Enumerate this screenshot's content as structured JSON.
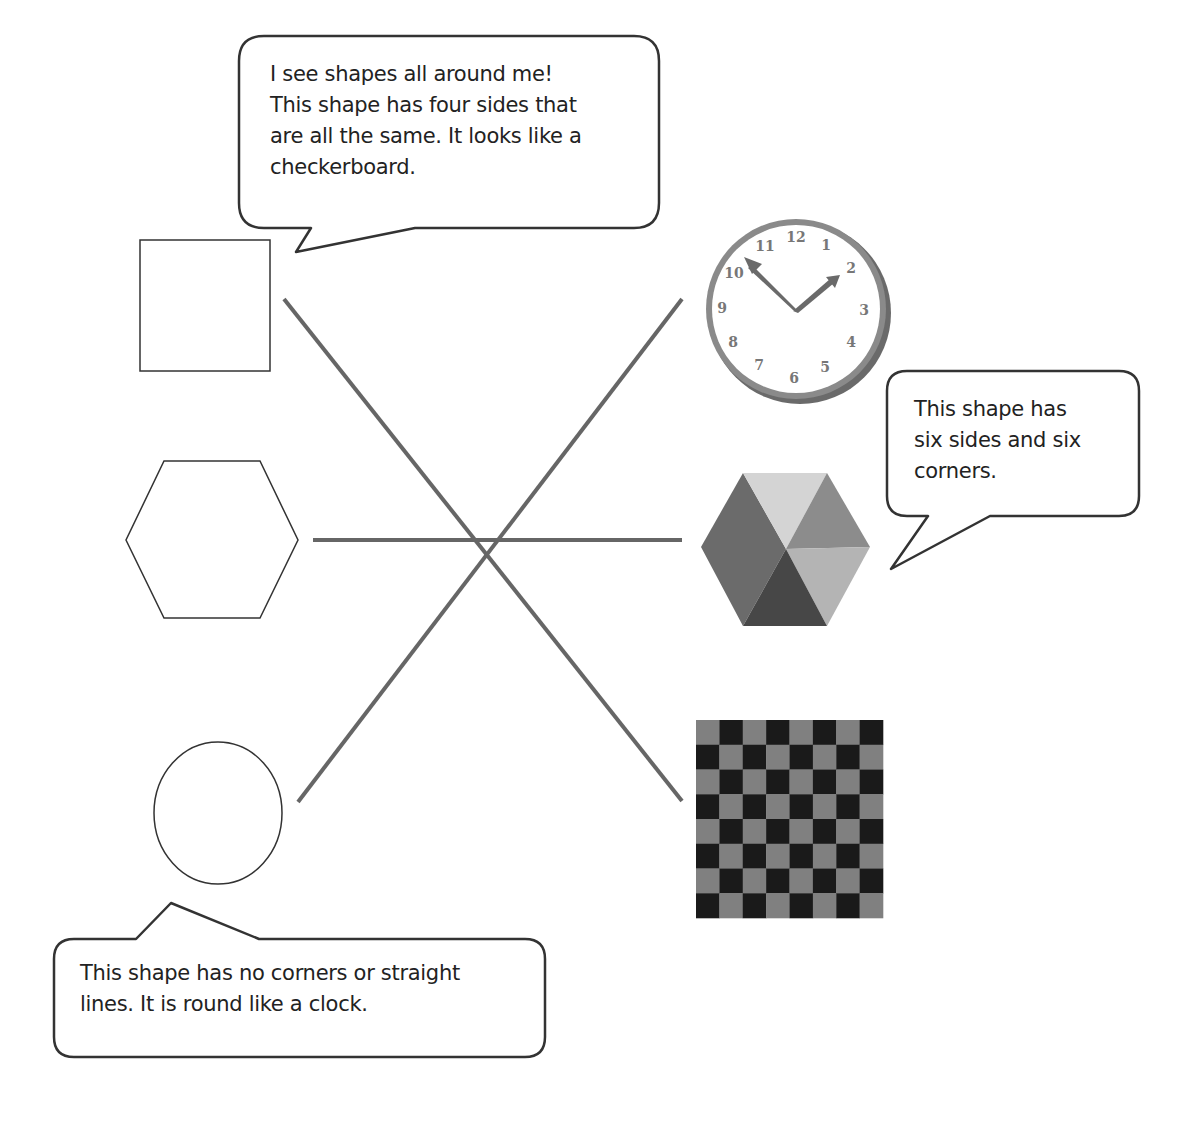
{
  "worksheet": {
    "title": "Match the shapes to real objects",
    "bubbles": [
      {
        "id": "square-bubble",
        "text": "I see shapes all around me!\nThis shape has four sides that\nare all the same.  It looks like a\ncheckerboard."
      },
      {
        "id": "hexagon-bubble",
        "text": "This shape has\nsix sides and six\ncorners."
      },
      {
        "id": "circle-bubble",
        "text": "This shape has no corners or straight\nlines.  It is round like a clock."
      }
    ],
    "left_shapes": [
      {
        "name": "square",
        "kind": "outline"
      },
      {
        "name": "hexagon",
        "kind": "outline"
      },
      {
        "name": "circle",
        "kind": "outline"
      }
    ],
    "right_objects": [
      {
        "name": "clock",
        "matches": "circle"
      },
      {
        "name": "colored-hexagon",
        "matches": "hexagon"
      },
      {
        "name": "checkerboard",
        "matches": "square"
      }
    ],
    "connections": [
      {
        "from": "square",
        "to": "checkerboard"
      },
      {
        "from": "hexagon",
        "to": "colored-hexagon"
      },
      {
        "from": "circle",
        "to": "clock"
      }
    ],
    "clock": {
      "numbers": [
        "12",
        "1",
        "2",
        "3",
        "4",
        "5",
        "6",
        "7",
        "8",
        "9",
        "10",
        "11"
      ],
      "time_shown": "10:10"
    },
    "checkerboard": {
      "rows": 8,
      "cols": 8
    },
    "colors": {
      "outline": "#333333",
      "connector_line": "#666666",
      "checker_light": "#808080",
      "checker_dark": "#1a1a1a",
      "hex_top": "#d4d4d4",
      "hex_upper_right": "#8c8c8c",
      "hex_lower_right": "#b4b4b4",
      "hex_bottom": "#474747",
      "hex_left": "#6b6b6b",
      "clock_rim": "#7a7a7a",
      "clock_numbers": "#777777"
    }
  }
}
